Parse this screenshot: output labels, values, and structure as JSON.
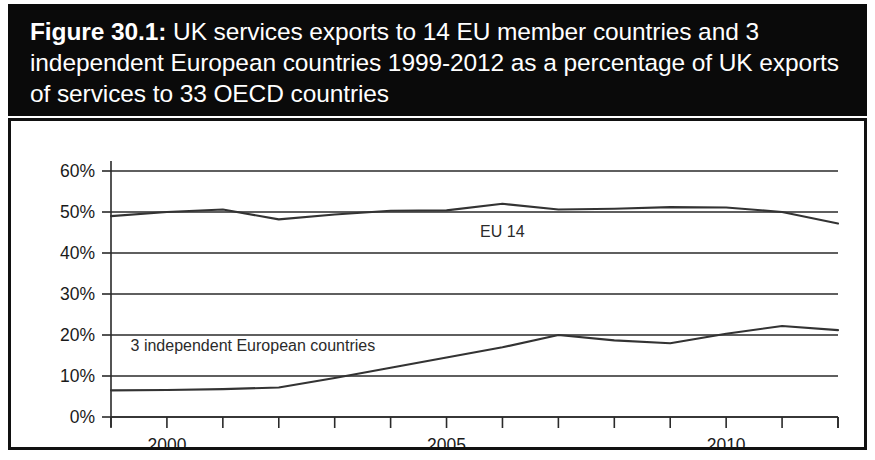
{
  "figure": {
    "number_label": "Figure 30.1:",
    "title_rest": " UK services exports to 14 EU member countries and 3 independent European countries 1999-2012 as a percentage of UK exports of services to 33 OECD countries",
    "band_color": "#0a0a0a",
    "band_text_color": "#ffffff"
  },
  "chart_data": {
    "type": "line",
    "title": "Figure 30.1: UK services exports to 14 EU member countries and 3 independent European countries 1999-2012 as a percentage of UK exports of services to 33 OECD countries",
    "xlabel": "",
    "ylabel": "",
    "x": [
      1999,
      2000,
      2001,
      2002,
      2003,
      2004,
      2005,
      2006,
      2007,
      2008,
      2009,
      2010,
      2011,
      2012
    ],
    "xlim": [
      1999,
      2012
    ],
    "ylim": [
      0,
      60
    ],
    "ytick_labels": [
      "0%",
      "10%",
      "20%",
      "30%",
      "40%",
      "50%",
      "60%"
    ],
    "ytick_values": [
      0,
      10,
      20,
      30,
      40,
      50,
      60
    ],
    "xtick_labels": [
      "2000",
      "2005",
      "2010"
    ],
    "xtick_values": [
      2000,
      2005,
      2010
    ],
    "grid": true,
    "legend": "inline-annotations",
    "series": [
      {
        "name": "EU 14",
        "label_x": 2005.6,
        "label_y": 44.0,
        "color": "#333333",
        "values": [
          49.0,
          50.0,
          50.6,
          48.2,
          49.4,
          50.3,
          50.4,
          52.0,
          50.6,
          50.8,
          51.2,
          51.1,
          50.0,
          47.2
        ]
      },
      {
        "name": "3 independent European countries",
        "label_x": 1999.35,
        "label_y": 16.2,
        "color": "#333333",
        "values": [
          6.5,
          6.6,
          6.8,
          7.2,
          9.5,
          12.0,
          14.5,
          17.0,
          20.0,
          18.7,
          18.0,
          20.3,
          22.2,
          21.2
        ]
      }
    ]
  }
}
